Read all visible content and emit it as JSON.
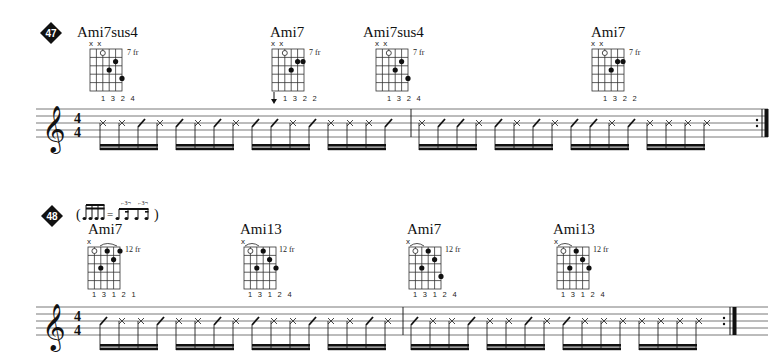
{
  "page": {
    "background": "#ffffff",
    "ink": "#111111"
  },
  "exercises": [
    {
      "number": "47",
      "time_signature": {
        "top": "4",
        "bottom": "4"
      },
      "clef": "treble",
      "chords": [
        {
          "name": "Ami7sus4",
          "muted": "x x",
          "fret": "7 fr",
          "fingers": "1 3 2 4"
        },
        {
          "name": "Ami7",
          "muted": "x x",
          "fret": "7 fr",
          "fingers": "1 3 2 2",
          "strum_arrow": "down"
        },
        {
          "name": "Ami7sus4",
          "muted": "x x",
          "fret": "7 fr",
          "fingers": "1 3 2 4"
        },
        {
          "name": "Ami7",
          "muted": "x x",
          "fret": "7 fr",
          "fingers": "1 3 2 2"
        }
      ],
      "rhythm": [
        [
          "X X / X",
          "/ X / X",
          "/ / X /",
          "X X X /"
        ],
        [
          "X / / X",
          "/ X / X",
          "/ / X /",
          "X X X X"
        ]
      ],
      "ending": "repeat"
    },
    {
      "number": "48",
      "swing_note": "( ♬♬ = ³♪♪ ³♪♪ )",
      "time_signature": {
        "top": "4",
        "bottom": "4"
      },
      "clef": "treble",
      "chords": [
        {
          "name": "Ami7",
          "muted": "x",
          "fret": "12 fr",
          "fingers": "1 3 1 2 1"
        },
        {
          "name": "Ami13",
          "muted": "x",
          "fret": "12 fr",
          "fingers": "1 3 1 2 4"
        },
        {
          "name": "Ami7",
          "muted": "x",
          "fret": "12 fr",
          "fingers": "1 3 1 2 4"
        },
        {
          "name": "Ami13",
          "muted": "x",
          "fret": "12 fr",
          "fingers": "1 3 1 2 4"
        }
      ],
      "rhythm": [
        [
          "/ X X /",
          "X X / X",
          "/ X X /",
          "X X / X"
        ],
        [
          "/ X X /",
          "X X / X",
          "/ X X X",
          "X X X X"
        ]
      ],
      "ending": "repeat"
    }
  ]
}
